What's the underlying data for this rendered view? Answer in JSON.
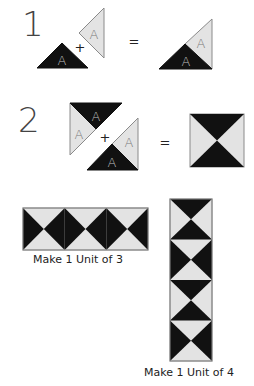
{
  "colors": {
    "dark": "#111111",
    "light": "#e3e3e3",
    "outline": "#8a8a8a",
    "text": "#222222",
    "step_number": "#444444",
    "piece_letter_on_dark": "#bdbdbd",
    "piece_letter_on_light": "#7a7a7a"
  },
  "steps": [
    {
      "number": "1",
      "operator_plus": "+",
      "operator_equals": "=",
      "pieces": [
        {
          "shape": "triangle",
          "fabric": "dark",
          "letter": "A"
        },
        {
          "shape": "triangle",
          "fabric": "light",
          "letter": "A"
        }
      ],
      "result": {
        "shape": "half-square-triangle",
        "letters": [
          "A",
          "A"
        ]
      }
    },
    {
      "number": "2",
      "operator_plus": "+",
      "operator_equals": "=",
      "pieces": [
        {
          "shape": "pieced-triangle",
          "letters": [
            "A",
            "A"
          ]
        },
        {
          "shape": "pieced-triangle",
          "letters": [
            "A",
            "A"
          ]
        }
      ],
      "result": {
        "shape": "hourglass-square"
      }
    }
  ],
  "units": [
    {
      "label": "Make 1 Unit of 3",
      "count": 3,
      "orientation": "horizontal"
    },
    {
      "label": "Make 1 Unit of 4",
      "count": 4,
      "orientation": "vertical"
    }
  ]
}
